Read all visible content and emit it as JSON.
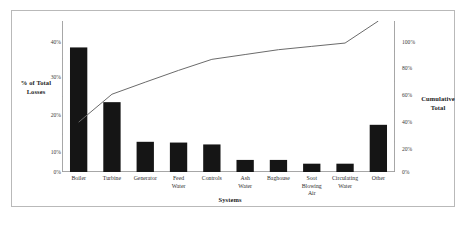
{
  "chart_data": {
    "type": "bar",
    "title": "",
    "subtitle": "",
    "xlabel": "Systems",
    "ylabel": "% of Total Losses",
    "y2label": "Cumulative Total",
    "categories": [
      "Boiler",
      "Turbine",
      "Generator",
      "Feed Water",
      "Controls",
      "Ash Water",
      "Baghouse",
      "Soot Blowing Air",
      "Circulating Water",
      "Other"
    ],
    "values": [
      33.0,
      18.5,
      8.0,
      7.8,
      7.3,
      3.2,
      3.2,
      2.2,
      2.2,
      12.5
    ],
    "cumulative": [
      33.0,
      51.5,
      59.5,
      67.3,
      74.6,
      77.8,
      81.0,
      83.2,
      85.4,
      100.0
    ],
    "ylim": [
      0,
      40
    ],
    "y2lim": [
      0,
      100
    ],
    "yticks": [
      "0%",
      "10%",
      "20%",
      "30%",
      "40%"
    ],
    "ytick_values": [
      0,
      10,
      20,
      30,
      40
    ],
    "y2ticks": [
      "0%",
      "20%",
      "40%",
      "60%",
      "80%",
      "100%"
    ],
    "y2tick_values": [
      0,
      20,
      40,
      60,
      80,
      100
    ],
    "grid": false,
    "legend": "none",
    "bar_color": "#151515",
    "line_color": "#6b6b6b",
    "axis_color": "#9d9d9d",
    "frame_color": "#b9b9b9"
  },
  "axes": {
    "left_title": "% of Total\nLosses",
    "left_title_line1": "% of Total",
    "left_title_line2": "Losses",
    "right_title_line1": "Cumulative",
    "right_title_line2": "Total",
    "x_title": "Systems"
  },
  "category_labels": [
    "Boiler",
    "Turbine",
    "Generator",
    "Feed\nWater",
    "Controls",
    "Ash\nWater",
    "Baghouse",
    "Soot\nBlowing\nAir",
    "Circulating\nWater",
    "Other"
  ]
}
